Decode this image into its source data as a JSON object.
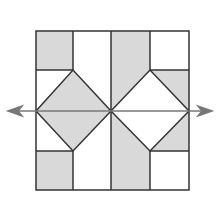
{
  "diagram": {
    "title": "",
    "colors": {
      "shade": "#d9d9d9",
      "stroke": "#333333",
      "arrow": "#777777",
      "background": "#ffffff"
    },
    "square": {
      "x": 36,
      "y": 31,
      "size": 153
    },
    "symmetry_line": {
      "y": 111,
      "x1": 8,
      "x2": 212,
      "label": ""
    }
  }
}
